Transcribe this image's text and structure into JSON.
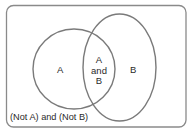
{
  "diagram": {
    "type": "venn",
    "universe": {
      "label": "(Not A) and (Not B)",
      "x": 6,
      "y": 5,
      "width": 180,
      "height": 122,
      "radius": 7
    },
    "sets": [
      {
        "id": "A",
        "label": "A",
        "cx": 74,
        "cy": 69,
        "rx": 41,
        "ry": 40
      },
      {
        "id": "B",
        "label": "B",
        "cx": 119.5,
        "cy": 67.5,
        "rx": 36.5,
        "ry": 53.5
      }
    ],
    "intersection": {
      "lines": [
        "A",
        "and",
        "B"
      ]
    },
    "colors": {
      "stroke": "#7a7a7a",
      "text": "#2a2a2a",
      "background": "#ffffff"
    }
  }
}
